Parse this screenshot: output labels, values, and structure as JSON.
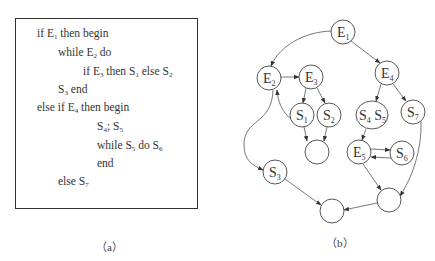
{
  "panel_a": {
    "caption": "（a）",
    "code_lines": [
      {
        "parts": [
          [
            "if E",
            ""
          ],
          [
            "1",
            "sub"
          ],
          [
            " then begin",
            ""
          ]
        ],
        "indent": 37,
        "y": 27
      },
      {
        "parts": [
          [
            "while E",
            ""
          ],
          [
            "2",
            "sub"
          ],
          [
            " do",
            ""
          ]
        ],
        "indent": 58,
        "y": 46
      },
      {
        "parts": [
          [
            "if E",
            ""
          ],
          [
            "3",
            "sub"
          ],
          [
            " then S",
            ""
          ],
          [
            "1",
            "sub"
          ],
          [
            " else S",
            ""
          ],
          [
            "2",
            "sub"
          ]
        ],
        "indent": 83,
        "y": 65
      },
      {
        "parts": [
          [
            "S",
            ""
          ],
          [
            "3",
            "sub"
          ],
          [
            " end",
            ""
          ]
        ],
        "indent": 58,
        "y": 83
      },
      {
        "parts": [
          [
            "else if E",
            ""
          ],
          [
            "4",
            "sub"
          ],
          [
            " then begin",
            ""
          ]
        ],
        "indent": 37,
        "y": 101
      },
      {
        "parts": [
          [
            "S",
            ""
          ],
          [
            "4",
            "sub"
          ],
          [
            "; S",
            ""
          ],
          [
            "5",
            "sub"
          ]
        ],
        "indent": 97,
        "y": 120
      },
      {
        "parts": [
          [
            "while S",
            ""
          ],
          [
            "5",
            "sub"
          ],
          [
            " do S",
            ""
          ],
          [
            "6",
            "sub"
          ]
        ],
        "indent": 97,
        "y": 139
      },
      {
        "parts": [
          [
            "end",
            ""
          ]
        ],
        "indent": 97,
        "y": 157
      },
      {
        "parts": [
          [
            "else S",
            ""
          ],
          [
            "7",
            "sub"
          ]
        ],
        "indent": 58,
        "y": 175
      }
    ]
  },
  "panel_b": {
    "caption": "（b）",
    "nodes": [
      {
        "id": "E1",
        "label": "E",
        "sub": "1",
        "cx": 343,
        "cy": 32,
        "r": 12
      },
      {
        "id": "E2",
        "label": "E",
        "sub": "2",
        "cx": 269,
        "cy": 78,
        "r": 12
      },
      {
        "id": "E3",
        "label": "E",
        "sub": "3",
        "cx": 311,
        "cy": 77,
        "r": 12
      },
      {
        "id": "E4",
        "label": "E",
        "sub": "4",
        "cx": 387,
        "cy": 73,
        "r": 12
      },
      {
        "id": "S1",
        "label": "S",
        "sub": "1",
        "cx": 302,
        "cy": 115,
        "r": 12
      },
      {
        "id": "S2",
        "label": "S",
        "sub": "2",
        "cx": 329,
        "cy": 115,
        "r": 12
      },
      {
        "id": "S4S5",
        "label": "S4 S5",
        "cx": 372,
        "cy": 115,
        "rx": 16,
        "ry": 14
      },
      {
        "id": "S7",
        "label": "S",
        "sub": "7",
        "cx": 413,
        "cy": 112,
        "r": 12
      },
      {
        "id": "J1",
        "label": "",
        "cx": 317,
        "cy": 152,
        "r": 12
      },
      {
        "id": "E5",
        "label": "E",
        "sub": "5",
        "cx": 359,
        "cy": 152,
        "r": 12
      },
      {
        "id": "S6",
        "label": "S",
        "sub": "6",
        "cx": 402,
        "cy": 153,
        "r": 12
      },
      {
        "id": "S3",
        "label": "S",
        "sub": "3",
        "cx": 275,
        "cy": 172,
        "r": 12
      },
      {
        "id": "J2",
        "label": "",
        "cx": 389,
        "cy": 200,
        "r": 12
      },
      {
        "id": "J3",
        "label": "",
        "cx": 332,
        "cy": 211,
        "r": 12
      }
    ],
    "edges": [
      [
        "E1",
        "E2"
      ],
      [
        "E1",
        "E4"
      ],
      [
        "E2",
        "E3"
      ],
      [
        "E3",
        "S1"
      ],
      [
        "E3",
        "S2"
      ],
      [
        "S1",
        "E2"
      ],
      [
        "S1",
        "J1"
      ],
      [
        "S2",
        "J1"
      ],
      [
        "E2",
        "S3"
      ],
      [
        "E4",
        "S4S5"
      ],
      [
        "E4",
        "S7"
      ],
      [
        "S4S5",
        "E5"
      ],
      [
        "E5",
        "S6"
      ],
      [
        "S6",
        "E5"
      ],
      [
        "E5",
        "J2"
      ],
      [
        "S7",
        "J2"
      ],
      [
        "S3",
        "J3"
      ],
      [
        "J2",
        "J3"
      ]
    ]
  }
}
